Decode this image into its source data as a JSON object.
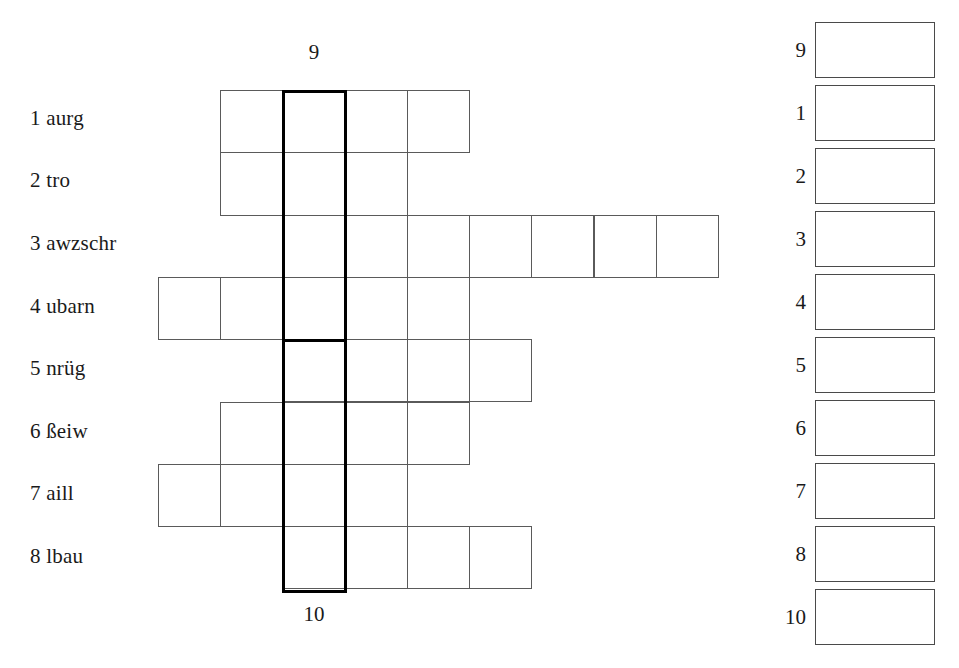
{
  "worksheet": {
    "title": "Anagram crossword worksheet",
    "column_caption_top": "9",
    "column_caption_bottom": "10"
  },
  "clues": [
    {
      "number": "1",
      "text": "1 aurg",
      "word": "aurg",
      "top": 108
    },
    {
      "number": "2",
      "text": "2 tro",
      "word": "tro",
      "top": 170
    },
    {
      "number": "3",
      "text": "3 awzschr",
      "word": "awzschr",
      "top": 233
    },
    {
      "number": "4",
      "text": "4 ubarn",
      "word": "ubarn",
      "top": 296
    },
    {
      "number": "5",
      "text": "5 nrüg",
      "word": "nrüg",
      "top": 358
    },
    {
      "number": "6",
      "text": "6 ßeiw",
      "word": "ßeiw",
      "top": 421
    },
    {
      "number": "7",
      "text": "7 aill",
      "word": "aill",
      "top": 483
    },
    {
      "number": "8",
      "text": "8 lbau",
      "word": "lbau",
      "top": 546
    }
  ],
  "grid": {
    "cell_width": 62.3,
    "cell_height": 62.3,
    "origin_y": 90,
    "bold_column_x": 282,
    "bold_column_top": 90,
    "bold_column_bottom": 590,
    "bold_divider_row_after": 4,
    "rows": [
      {
        "row": 1,
        "start_x": 220,
        "cells": 4
      },
      {
        "row": 2,
        "start_x": 220,
        "cells": 3
      },
      {
        "row": 3,
        "start_x": 282,
        "cells": 7
      },
      {
        "row": 4,
        "start_x": 158,
        "cells": 5
      },
      {
        "row": 5,
        "start_x": 282,
        "cells": 4
      },
      {
        "row": 6,
        "start_x": 220,
        "cells": 4
      },
      {
        "row": 7,
        "start_x": 158,
        "cells": 4
      },
      {
        "row": 8,
        "start_x": 282,
        "cells": 4
      }
    ]
  },
  "answer_panel": {
    "rows": [
      {
        "label": "9",
        "top": 22
      },
      {
        "label": "1",
        "top": 85
      },
      {
        "label": "2",
        "top": 148
      },
      {
        "label": "3",
        "top": 211
      },
      {
        "label": "4",
        "top": 274
      },
      {
        "label": "5",
        "top": 337
      },
      {
        "label": "6",
        "top": 400
      },
      {
        "label": "7",
        "top": 463
      },
      {
        "label": "8",
        "top": 526
      },
      {
        "label": "10",
        "top": 589
      }
    ]
  },
  "colors": {
    "grid_line": "#5a5a5a",
    "bold_line": "#000000",
    "text": "#1a1a1a",
    "background": "#ffffff"
  }
}
